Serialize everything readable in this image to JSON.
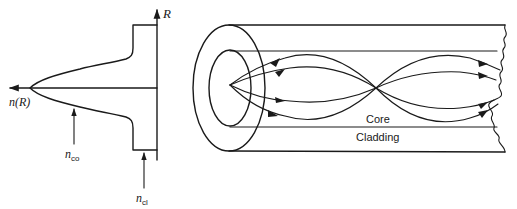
{
  "figure": {
    "type": "optical-fiber-diagram",
    "profile": {
      "axis_vertical_label": "R",
      "axis_horizontal_label": "n(R)",
      "core_index_label": {
        "base": "n",
        "sub": "co"
      },
      "cladding_index_label": {
        "base": "n",
        "sub": "cl"
      }
    },
    "fiber": {
      "core_label": "Core",
      "cladding_label": "Cladding",
      "ray_count": 4
    },
    "colors": {
      "ink": "#1a1a1a",
      "background": "#ffffff"
    }
  }
}
